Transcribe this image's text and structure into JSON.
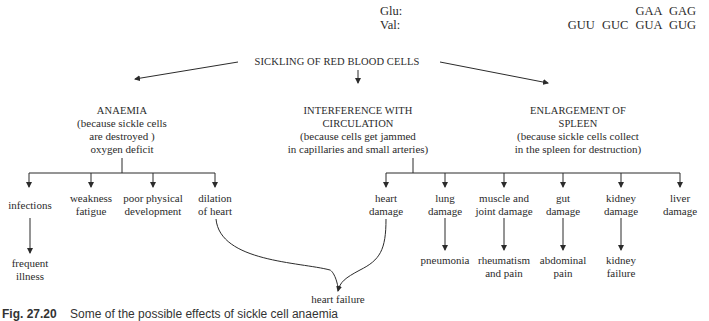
{
  "codons": {
    "glu_label": "Glu:",
    "val_label": "Val:",
    "glu_codons": "GAA  GAG",
    "val_codons": "GUU  GUC  GUA  GUG"
  },
  "root": {
    "label": "SICKLING OF RED BLOOD CELLS"
  },
  "branches": [
    {
      "title": "ANAEMIA",
      "lines": [
        "(because sickle cells",
        "are destroyed )",
        "oxygen deficit"
      ],
      "children": [
        {
          "lines": [
            "infections"
          ],
          "result": [
            "frequent",
            "illness"
          ]
        },
        {
          "lines": [
            "weakness",
            "fatigue"
          ]
        },
        {
          "lines": [
            "poor physical",
            "development"
          ]
        },
        {
          "lines": [
            "dilation",
            "of heart"
          ]
        }
      ]
    },
    {
      "title_lines": [
        "INTERFERENCE WITH",
        "CIRCULATION"
      ],
      "lines": [
        "(because cells get jammed",
        "in capillaries and small arteries)"
      ],
      "children": [
        {
          "lines": [
            "heart",
            "damage"
          ]
        },
        {
          "lines": [
            "lung",
            "damage"
          ],
          "result": [
            "pneumonia"
          ]
        },
        {
          "lines": [
            "muscle and",
            "joint damage"
          ],
          "result": [
            "rheumatism",
            "and pain"
          ]
        },
        {
          "lines": [
            "gut",
            "damage"
          ],
          "result": [
            "abdominal",
            "pain"
          ]
        },
        {
          "lines": [
            "kidney",
            "damage"
          ],
          "result": [
            "kidney",
            "failure"
          ]
        },
        {
          "lines": [
            "liver",
            "damage"
          ]
        }
      ]
    },
    {
      "title_lines": [
        "ENLARGEMENT OF",
        "SPLEEN"
      ],
      "lines": [
        "(because sickle cells collect",
        "in the spleen for destruction)"
      ]
    }
  ],
  "convergence": {
    "label": "heart failure",
    "from": [
      "dilation of heart",
      "heart damage"
    ]
  },
  "caption": {
    "number": "Fig. 27.20",
    "text": "Some of the possible effects of sickle cell anaemia"
  },
  "colors": {
    "ink": "#2b2b2b",
    "background": "#ffffff"
  }
}
